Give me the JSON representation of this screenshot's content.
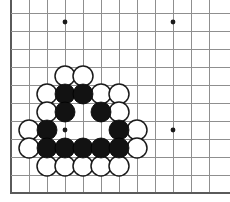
{
  "figure": {
    "kind": "go-board-diagram",
    "caption": "Go board position diagram showing a black group enclosed by white stones in the lower left area of the board.",
    "width": 230,
    "height": 202,
    "background_color": "#ffffff"
  },
  "board": {
    "origin_x": 11,
    "origin_y": 13,
    "spacing": 18,
    "columns": 12,
    "rows": 10,
    "line_color": "#8f8f8f",
    "edge_color": "#5a5a5a",
    "left_edge_is_border": true,
    "bottom_edge_is_border": true,
    "right_edge_is_cropped": true,
    "top_edge_is_cropped": true,
    "x_coords": [
      11,
      29,
      47,
      65,
      83,
      101,
      119,
      137,
      155,
      173,
      191,
      209
    ],
    "y_coords": [
      13,
      31,
      49,
      67,
      85,
      103,
      121,
      139,
      157,
      175
    ]
  },
  "star_points": {
    "radius": 2.4,
    "color": "#1a1a1a",
    "points": [
      {
        "x": 65,
        "y": 22
      },
      {
        "x": 173,
        "y": 22
      },
      {
        "x": 65,
        "y": 130
      },
      {
        "x": 173,
        "y": 130
      }
    ]
  },
  "stones": {
    "radius": 10,
    "black_color": "#121212",
    "white_color": "#ffffff",
    "white_outline_color": "#1a1a1a",
    "black_count": 13,
    "white_count": 18,
    "black": [
      {
        "x": 65,
        "y": 94
      },
      {
        "x": 83,
        "y": 94
      },
      {
        "x": 65,
        "y": 112
      },
      {
        "x": 101,
        "y": 112
      },
      {
        "x": 47,
        "y": 130
      },
      {
        "x": 119,
        "y": 130
      },
      {
        "x": 47,
        "y": 148
      },
      {
        "x": 65,
        "y": 148
      },
      {
        "x": 83,
        "y": 148
      },
      {
        "x": 101,
        "y": 148
      },
      {
        "x": 119,
        "y": 148
      }
    ],
    "white": [
      {
        "x": 65,
        "y": 76
      },
      {
        "x": 83,
        "y": 76
      },
      {
        "x": 47,
        "y": 94
      },
      {
        "x": 101,
        "y": 94
      },
      {
        "x": 119,
        "y": 94
      },
      {
        "x": 47,
        "y": 112
      },
      {
        "x": 119,
        "y": 112
      },
      {
        "x": 29,
        "y": 130
      },
      {
        "x": 137,
        "y": 130
      },
      {
        "x": 29,
        "y": 148
      },
      {
        "x": 137,
        "y": 148
      },
      {
        "x": 47,
        "y": 166
      },
      {
        "x": 65,
        "y": 166
      },
      {
        "x": 83,
        "y": 166
      },
      {
        "x": 101,
        "y": 166
      },
      {
        "x": 119,
        "y": 166
      }
    ]
  }
}
